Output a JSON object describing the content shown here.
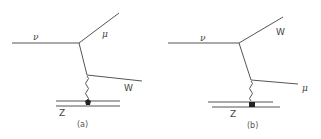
{
  "diagrams": [
    {
      "caption": "(a)",
      "incoming": {
        "label": "ν"
      },
      "outgoing_upper": {
        "label": "μ"
      },
      "outgoing_lower": {
        "label": "W"
      },
      "target": {
        "label": "Z"
      },
      "exchange": "photon"
    },
    {
      "caption": "(b)",
      "incoming": {
        "label": "ν"
      },
      "outgoing_upper": {
        "label": "W"
      },
      "outgoing_lower": {
        "label": "μ"
      },
      "target": {
        "label": "Z"
      },
      "exchange": "photon"
    }
  ],
  "colors": {
    "line": "#555555",
    "text": "#444444",
    "background": "#ffffff"
  }
}
